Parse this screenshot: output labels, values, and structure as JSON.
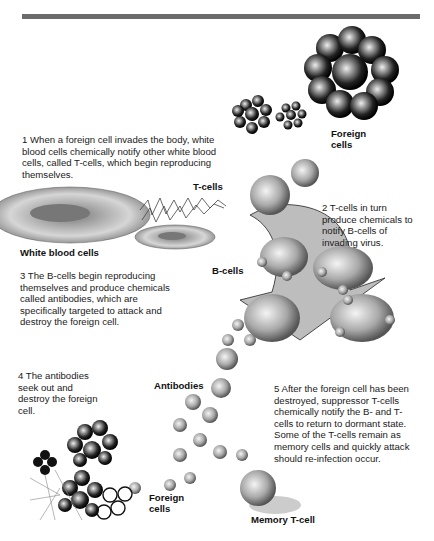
{
  "diagram": {
    "header_bar_color": "#6b6b6b",
    "steps": [
      {
        "number": "1",
        "text": "When a foreign cell invades the body, white blood cells chemically notify other white blood cells, called T-cells, which begin reproducing themselves."
      },
      {
        "number": "2",
        "text": "T-cells in turn produce chemicals to notify B-cells of invading virus."
      },
      {
        "number": "3",
        "text": "The B-cells begin reproducing themselves and produce chemicals called antibodies, which are specifically targeted to attack and destroy the foreign cell."
      },
      {
        "number": "4",
        "text": "The antibodies seek out and destroy the foreign cell."
      },
      {
        "number": "5",
        "text": "After the foreign cell has been destroyed, suppressor T-cells chemically notify the B- and T-cells to return to dormant state. Some of the T-cells remain as memory cells and quickly attack should re-infection occur."
      }
    ],
    "labels": {
      "foreign_cells_top": "Foreign cells",
      "t_cells": "T-cells",
      "white_blood_cells": "White blood cells",
      "b_cells": "B-cells",
      "antibodies": "Antibodies",
      "foreign_cells_bottom": "Foreign cells",
      "memory_t_cell": "Memory T-cell"
    }
  }
}
